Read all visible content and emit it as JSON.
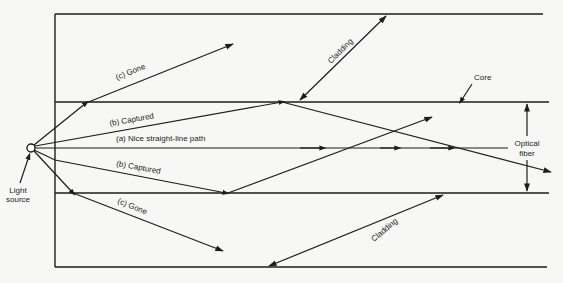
{
  "diagram": {
    "labels": {
      "gone_upper": "(c)   Gone",
      "gone_lower": "(c)   Gone",
      "captured_upper": "(b)   Captured",
      "captured_lower": "(b)   Captured",
      "straight": "(a)   Nice straight-line path",
      "cladding_top": "Cladding",
      "cladding_bottom": "Cladding",
      "core": "Core",
      "optical_fiber_line1": "Optical",
      "optical_fiber_line2": "fiber",
      "light_source_line1": "Light",
      "light_source_line2": "source"
    },
    "rays": [
      {
        "id": "a",
        "name": "Nice straight-line path",
        "type": "axial"
      },
      {
        "id": "b",
        "name": "Captured",
        "type": "total internal reflection"
      },
      {
        "id": "c",
        "name": "Gone",
        "type": "escapes through cladding"
      }
    ],
    "colors": {
      "ink": "#1d1d1d",
      "background": "#f7f7f5"
    }
  }
}
